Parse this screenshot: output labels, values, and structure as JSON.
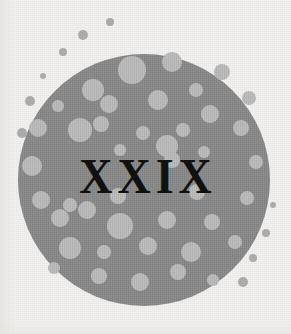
{
  "illustration": {
    "kind": "chapter-opener-ornament",
    "caption_text": "XXIX",
    "background_color": "#f3f2f0",
    "disc": {
      "fill_color": "#8b8b8b",
      "center_x": 144,
      "center_y": 180,
      "radius": 126
    },
    "numeral": {
      "text": "XXIX",
      "color": "#111111",
      "center_x": 144,
      "baseline_y": 196,
      "cap_height_px": 36
    },
    "dots_inside": {
      "color": "#bcbcbc",
      "items": [
        {
          "cx": 132,
          "cy": 70,
          "r": 14
        },
        {
          "cx": 172,
          "cy": 62,
          "r": 10
        },
        {
          "cx": 222,
          "cy": 72,
          "r": 8
        },
        {
          "cx": 93,
          "cy": 90,
          "r": 11
        },
        {
          "cx": 196,
          "cy": 90,
          "r": 7
        },
        {
          "cx": 249,
          "cy": 98,
          "r": 7
        },
        {
          "cx": 58,
          "cy": 106,
          "r": 6
        },
        {
          "cx": 109,
          "cy": 104,
          "r": 9
        },
        {
          "cx": 158,
          "cy": 100,
          "r": 10
        },
        {
          "cx": 210,
          "cy": 114,
          "r": 9
        },
        {
          "cx": 38,
          "cy": 128,
          "r": 9
        },
        {
          "cx": 80,
          "cy": 130,
          "r": 12
        },
        {
          "cx": 101,
          "cy": 124,
          "r": 8
        },
        {
          "cx": 143,
          "cy": 133,
          "r": 7
        },
        {
          "cx": 183,
          "cy": 130,
          "r": 7
        },
        {
          "cx": 241,
          "cy": 128,
          "r": 8
        },
        {
          "cx": 120,
          "cy": 150,
          "r": 6
        },
        {
          "cx": 167,
          "cy": 146,
          "r": 11
        },
        {
          "cx": 172,
          "cy": 160,
          "r": 8
        },
        {
          "cx": 204,
          "cy": 152,
          "r": 6
        },
        {
          "cx": 32,
          "cy": 166,
          "r": 10
        },
        {
          "cx": 256,
          "cy": 162,
          "r": 7
        },
        {
          "cx": 41,
          "cy": 200,
          "r": 9
        },
        {
          "cx": 70,
          "cy": 205,
          "r": 7
        },
        {
          "cx": 118,
          "cy": 196,
          "r": 8
        },
        {
          "cx": 197,
          "cy": 192,
          "r": 8
        },
        {
          "cx": 247,
          "cy": 198,
          "r": 7
        },
        {
          "cx": 60,
          "cy": 218,
          "r": 9
        },
        {
          "cx": 87,
          "cy": 210,
          "r": 9
        },
        {
          "cx": 120,
          "cy": 226,
          "r": 13
        },
        {
          "cx": 167,
          "cy": 220,
          "r": 9
        },
        {
          "cx": 212,
          "cy": 222,
          "r": 8
        },
        {
          "cx": 70,
          "cy": 248,
          "r": 11
        },
        {
          "cx": 104,
          "cy": 252,
          "r": 7
        },
        {
          "cx": 148,
          "cy": 246,
          "r": 9
        },
        {
          "cx": 191,
          "cy": 252,
          "r": 10
        },
        {
          "cx": 235,
          "cy": 242,
          "r": 7
        },
        {
          "cx": 99,
          "cy": 276,
          "r": 8
        },
        {
          "cx": 140,
          "cy": 282,
          "r": 9
        },
        {
          "cx": 178,
          "cy": 272,
          "r": 8
        },
        {
          "cx": 213,
          "cy": 280,
          "r": 6
        },
        {
          "cx": 54,
          "cy": 268,
          "r": 6
        }
      ]
    },
    "dots_outside": {
      "color": "#aeaeae",
      "items": [
        {
          "cx": 110,
          "cy": 22,
          "r": 4
        },
        {
          "cx": 83,
          "cy": 35,
          "r": 5
        },
        {
          "cx": 63,
          "cy": 52,
          "r": 4
        },
        {
          "cx": 43,
          "cy": 76,
          "r": 3
        },
        {
          "cx": 30,
          "cy": 101,
          "r": 5
        },
        {
          "cx": 22,
          "cy": 133,
          "r": 5
        },
        {
          "cx": 266,
          "cy": 233,
          "r": 4
        },
        {
          "cx": 253,
          "cy": 258,
          "r": 4
        },
        {
          "cx": 243,
          "cy": 282,
          "r": 5
        },
        {
          "cx": 273,
          "cy": 205,
          "r": 3
        }
      ]
    }
  }
}
